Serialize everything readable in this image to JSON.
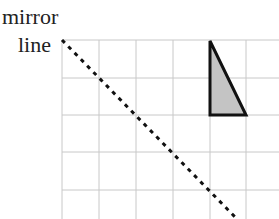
{
  "labels": {
    "line1": "mirror",
    "line2": "line"
  },
  "colors": {
    "grid": "#c8c8c8",
    "shape_fill": "#c4c4c4",
    "shape_stroke": "#111111",
    "mirror_line": "#111111"
  },
  "grid": {
    "x": [
      62,
      99,
      136,
      173,
      210,
      246
    ],
    "y": [
      40,
      78,
      115,
      152,
      190
    ],
    "x_end": 279,
    "y_end": 219
  },
  "shape": {
    "type": "right-triangle",
    "points": [
      [
        210,
        41
      ],
      [
        210,
        115
      ],
      [
        246,
        115
      ]
    ]
  },
  "mirror_line": {
    "from": [
      62,
      40
    ],
    "to": [
      237,
      219
    ],
    "style": "dotted"
  }
}
